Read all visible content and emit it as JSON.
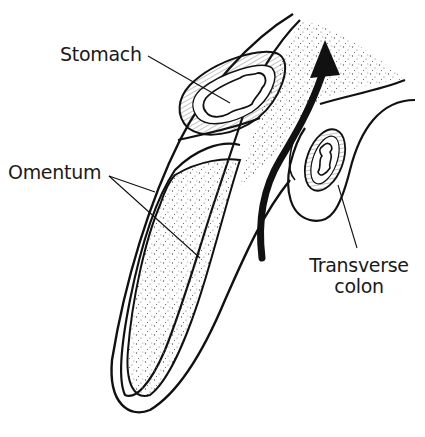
{
  "diagram": {
    "type": "anatomical-cross-section",
    "colors": {
      "ink": "#111111",
      "background": "#ffffff",
      "stipple": "#555555"
    },
    "labels": {
      "stomach": "Stomach",
      "omentum": "Omentum",
      "transverse_colon_line1": "Transverse",
      "transverse_colon_line2": "colon"
    },
    "structures": [
      {
        "name": "stomach",
        "label": "Stomach"
      },
      {
        "name": "omentum",
        "label": "Omentum"
      },
      {
        "name": "transverse-colon",
        "label": "Transverse colon"
      },
      {
        "name": "arrow",
        "direction": "up"
      }
    ]
  }
}
